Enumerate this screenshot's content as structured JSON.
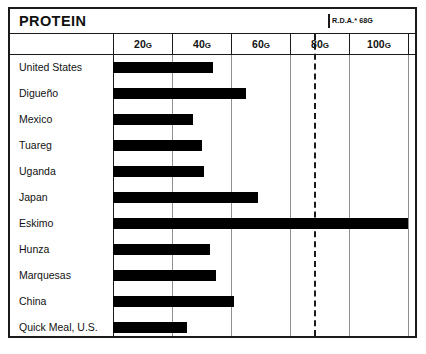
{
  "header": {
    "title": "PROTEIN",
    "rda_note": "R.D.A.* 68G"
  },
  "chart_data": {
    "type": "bar",
    "orientation": "horizontal",
    "title": "PROTEIN",
    "xlabel": "",
    "ylabel": "",
    "xlim": [
      0,
      110
    ],
    "grid": true,
    "legend": "none",
    "unit": "G",
    "tick_labels": [
      "20G",
      "40G",
      "60G",
      "80G",
      "100G"
    ],
    "ticks": [
      20,
      40,
      60,
      80,
      100
    ],
    "reference_line": {
      "label": "R.D.A.* 68G",
      "value": 68,
      "style": "dashed"
    },
    "categories": [
      "United States",
      "Digueño",
      "Mexico",
      "Tuareg",
      "Uganda",
      "Japan",
      "Eskimo",
      "Hunza",
      "Marquesas",
      "China",
      "Quick Meal, U.S."
    ],
    "values": [
      34,
      45,
      27,
      30,
      31,
      49,
      100,
      33,
      35,
      41,
      25
    ]
  },
  "colors": {
    "bar": "#000000",
    "frame": "#1a1a1a",
    "gridline": "#8f8f8f",
    "background": "#ffffff"
  }
}
